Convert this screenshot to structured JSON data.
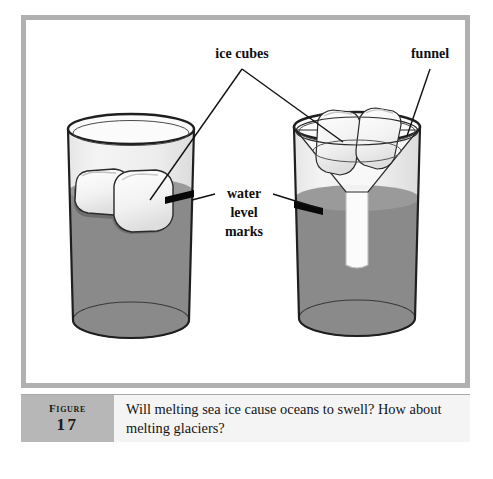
{
  "figure": {
    "label_word": "Figure",
    "label_number": "17",
    "caption": "Will melting sea ice cause oceans to swell? How about melting glaciers?"
  },
  "annotations": {
    "ice_cubes": "ice cubes",
    "funnel": "funnel",
    "water_level_line1": "water",
    "water_level_line2": "level",
    "water_level_line3": "marks"
  },
  "colors": {
    "panel_border": "#b0b0b0",
    "caption_block": "#b7b7b7",
    "caption_panel": "#f4f4f4",
    "water": "#8a8a8a",
    "water_submerged_ice": "#6f6f6f",
    "glass_outline": "#1f1f1f",
    "glass_body": "#efefef",
    "ice_white": "#fcfcfc",
    "level_mark": "#080808",
    "page_background": "#ffffff"
  },
  "scene": {
    "left_glass_name": "glass with floating ice cubes",
    "right_glass_name": "glass with funnel holding ice cubes"
  }
}
